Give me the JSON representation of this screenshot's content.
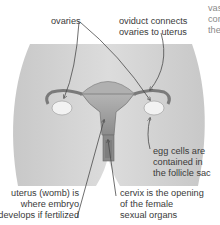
{
  "diagram": {
    "colors": {
      "body_fill": "#d2d2d2",
      "organ_fill": "#a9a9a9",
      "ovary_fill": "#f2f2f2",
      "leader_line": "#4a4a4a",
      "text": "#3a3a3a"
    },
    "labels": {
      "ovaries": "ovaries",
      "oviduct_line1": "oviduct connects",
      "oviduct_line2": "ovaries to uterus",
      "vagina_line1": "vas",
      "vagina_line2": "con",
      "vagina_line3": "the",
      "egg_line1": "egg cells are",
      "egg_line2": "contained in",
      "egg_line3": "the follicle sac",
      "uterus_line1": "uterus (womb) is",
      "uterus_line2": "where embryo",
      "uterus_line3": "develops if fertilized",
      "cervix_line1": "cervix is the opening",
      "cervix_line2": "of the female",
      "cervix_line3": "sexual organs"
    }
  }
}
